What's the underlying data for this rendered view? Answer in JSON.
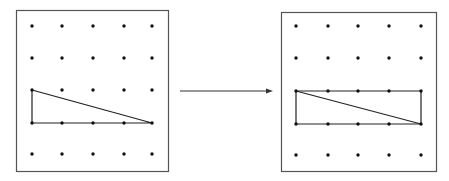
{
  "diagram": {
    "colors": {
      "frame": "#555555",
      "dot": "#111111",
      "line": "#222222",
      "arrow": "#333333",
      "background": "#ffffff"
    },
    "grid": {
      "rows": 5,
      "cols": 5
    },
    "left_panel": {
      "frame": {
        "x": 16,
        "y": 10,
        "w": 152,
        "h": 161
      },
      "dot_x": [
        32,
        62,
        93,
        124,
        152
      ],
      "dot_y": [
        26,
        58,
        90,
        123,
        154
      ],
      "shape": "right-triangle",
      "polygon_cells": [
        [
          0,
          2
        ],
        [
          0,
          3
        ],
        [
          4,
          3
        ]
      ]
    },
    "arrow": {
      "x1": 180,
      "y1": 91,
      "x2": 273,
      "y2": 91,
      "direction": "right"
    },
    "right_panel": {
      "frame": {
        "x": 281,
        "y": 12,
        "w": 155,
        "h": 159
      },
      "dot_x": [
        296,
        328,
        358,
        389,
        421
      ],
      "dot_y": [
        26,
        58,
        91,
        124,
        155
      ],
      "shape": "rectangle-with-diagonal",
      "polygon_cells": [
        [
          0,
          2
        ],
        [
          4,
          2
        ],
        [
          4,
          3
        ],
        [
          0,
          3
        ]
      ],
      "diagonal_cells": [
        [
          0,
          2
        ],
        [
          4,
          3
        ]
      ]
    }
  }
}
